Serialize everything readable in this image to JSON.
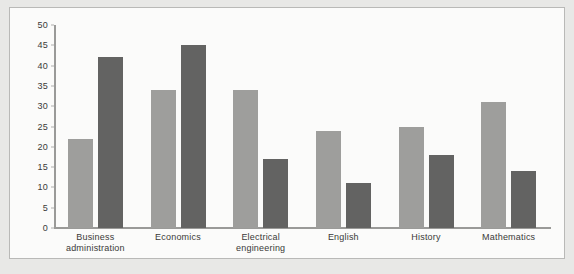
{
  "chart_data": {
    "type": "bar",
    "title": "",
    "subtitle": "",
    "xlabel": "",
    "ylabel": "",
    "ylim": [
      0,
      50
    ],
    "ytick_step": 5,
    "yticks": [
      0,
      5,
      10,
      15,
      20,
      25,
      30,
      35,
      40,
      45,
      50
    ],
    "grid": false,
    "legend": "none",
    "categories": [
      "Business\nadministration",
      "Economics",
      "Electrical\nengineering",
      "English",
      "History",
      "Mathematics"
    ],
    "category_labels": [
      {
        "line1": "Business",
        "line2": "administration"
      },
      {
        "line1": "Economics",
        "line2": ""
      },
      {
        "line1": "Electrical",
        "line2": "engineering"
      },
      {
        "line1": "English",
        "line2": ""
      },
      {
        "line1": "History",
        "line2": ""
      },
      {
        "line1": "Mathematics",
        "line2": ""
      }
    ],
    "series": [
      {
        "name": "series-1",
        "color": "#9e9e9c",
        "values": [
          22,
          34,
          34,
          24,
          25,
          31
        ]
      },
      {
        "name": "series-2",
        "color": "#636362",
        "values": [
          42,
          45,
          17,
          11,
          18,
          14
        ]
      }
    ]
  },
  "colors": {
    "page_background": "#e8e8e6",
    "panel_background": "#fbfbfa",
    "panel_border": "#b9b9b7",
    "axis": "#9a9a98",
    "text": "#3a3a38",
    "series_light": "#9e9e9c",
    "series_dark": "#636362"
  }
}
